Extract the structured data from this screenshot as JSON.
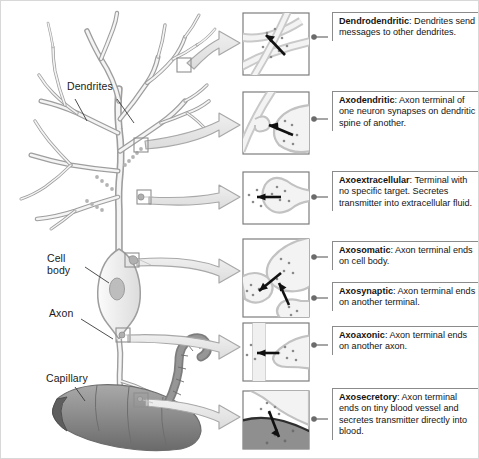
{
  "figure": {
    "background": "#ffffff",
    "border_color": "#d8d8d8"
  },
  "colors": {
    "neuron_fill": "#f2f2f2",
    "neuron_outline": "#9a9a9a",
    "soma_fill": "#ececec",
    "nucleus_fill": "#bdbdbd",
    "capillary_fill": "#8d8d8d",
    "capillary_dark": "#6f6f6f",
    "block_arrow_fill": "#e3e3e3",
    "block_arrow_outline": "#a6a6a6",
    "panel_border": "#7d7d7d",
    "rule_color": "#8b8b8b",
    "leader_color": "#6b6b6b",
    "text_color": "#141414",
    "vesicle_color": "#7a7a7a",
    "arrow_black": "#111111"
  },
  "neuron_labels": [
    {
      "name": "dendrites",
      "text": "Dendrites",
      "x": 66,
      "y": 86
    },
    {
      "name": "cell-body",
      "text": "Cell\nbody",
      "x": 46,
      "y": 258
    },
    {
      "name": "axon",
      "text": "Axon",
      "x": 48,
      "y": 312
    },
    {
      "name": "capillary",
      "text": "Capillary",
      "x": 45,
      "y": 377
    }
  ],
  "captions": [
    {
      "id": "dendrodendritic",
      "term": "Dendrodendritic",
      "text": ": Dendrites send messages to other dendrites.",
      "x": 331,
      "y": 11,
      "w": 146,
      "h": 48
    },
    {
      "id": "axodendritic",
      "term": "Axodendritic",
      "text": ": Axon terminal of one neuron synapses on dendritic spine of another.",
      "x": 331,
      "y": 90,
      "w": 146,
      "h": 48
    },
    {
      "id": "axoextracellular",
      "term": "Axoextracellular",
      "text": ": Terminal with no specific target. Secretes transmitter into extracellular fluid.",
      "x": 331,
      "y": 170,
      "w": 146,
      "h": 58
    },
    {
      "id": "axosomatic",
      "term": "Axosomatic",
      "text": ": Axon terminal ends on cell body.",
      "x": 331,
      "y": 240,
      "w": 146,
      "h": 36
    },
    {
      "id": "axosynaptic",
      "term": "Axosynaptic",
      "text": ": Axon terminal ends on another terminal.",
      "x": 331,
      "y": 281,
      "w": 146,
      "h": 36
    },
    {
      "id": "axoaxonic",
      "term": "Axoaxonic",
      "text": ": Axon terminal ends on another axon.",
      "x": 331,
      "y": 325,
      "w": 146,
      "h": 36
    },
    {
      "id": "axosecretory",
      "term": "Axosecretory",
      "text": ": Axon terminal ends on tiny blood vessel and secretes transmitter directly into blood.",
      "x": 331,
      "y": 387,
      "w": 146,
      "h": 60
    }
  ],
  "panels": [
    {
      "id": "panel-dendrodendritic",
      "x": 242,
      "y": 12,
      "w": 66,
      "h": 62,
      "icon": "crossing-dendrites-with-vesicles"
    },
    {
      "id": "panel-axodendritic",
      "x": 242,
      "y": 91,
      "w": 66,
      "h": 62,
      "icon": "terminal-on-dendritic-spine"
    },
    {
      "id": "panel-axoextracellular",
      "x": 242,
      "y": 171,
      "w": 66,
      "h": 52,
      "icon": "terminal-releasing-into-fluid"
    },
    {
      "id": "panel-axosomatic-axosynaptic",
      "x": 242,
      "y": 238,
      "w": 66,
      "h": 78,
      "icon": "terminal-on-soma-and-terminal"
    },
    {
      "id": "panel-axoaxonic",
      "x": 242,
      "y": 322,
      "w": 66,
      "h": 58,
      "icon": "terminal-on-axon"
    },
    {
      "id": "panel-axosecretory",
      "x": 242,
      "y": 390,
      "w": 66,
      "h": 58,
      "icon": "terminal-on-capillary"
    }
  ],
  "callout_markers": [
    {
      "id": "marker-dendrodendritic",
      "x": 176,
      "y": 57,
      "size": 13
    },
    {
      "id": "marker-axodendritic",
      "x": 133,
      "y": 137,
      "size": 13
    },
    {
      "id": "marker-axoextracellular",
      "x": 136,
      "y": 192,
      "size": 13
    },
    {
      "id": "marker-axosomatic",
      "x": 124,
      "y": 258,
      "size": 13
    },
    {
      "id": "marker-axoaxonic",
      "x": 115,
      "y": 330,
      "size": 13
    },
    {
      "id": "marker-axosecretory",
      "x": 133,
      "y": 396,
      "size": 13
    }
  ]
}
